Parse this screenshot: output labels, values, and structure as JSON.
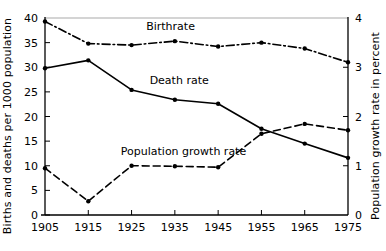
{
  "chart_data": {
    "type": "line",
    "title": "",
    "xlabel": "",
    "ylabel": "Births and deaths per 1000 population",
    "ylabel_right": "Population growth rate in percent",
    "x": [
      1905,
      1915,
      1925,
      1935,
      1945,
      1955,
      1965,
      1975
    ],
    "xtick_labels": [
      "1905",
      "1915",
      "1925",
      "1935",
      "1945",
      "1955",
      "1965",
      "1975"
    ],
    "xlim": [
      1905,
      1975
    ],
    "ylim": [
      0,
      40
    ],
    "ytick_labels": [
      "0",
      "5",
      "10",
      "15",
      "20",
      "25",
      "30",
      "35",
      "40"
    ],
    "yticks": [
      0,
      5,
      10,
      15,
      20,
      25,
      30,
      35,
      40
    ],
    "ylim_right": [
      0,
      4
    ],
    "ytick_labels_right": [
      "0",
      "1",
      "2",
      "3",
      "4"
    ],
    "yticks_right": [
      0,
      1,
      2,
      3,
      4
    ],
    "grid": false,
    "legend": "inline-annotations",
    "series": [
      {
        "name": "Birthrate",
        "axis": "left",
        "style": "dash-dot",
        "label_x": 1934,
        "label_y": 37.6,
        "values": [
          39.3,
          34.8,
          34.5,
          35.3,
          34.2,
          35.0,
          33.8,
          31.0
        ]
      },
      {
        "name": "Death rate",
        "axis": "left",
        "style": "solid",
        "label_x": 1936,
        "label_y": 26.6,
        "values": [
          29.8,
          31.4,
          25.4,
          23.4,
          22.6,
          17.5,
          14.5,
          11.6
        ]
      },
      {
        "name": "Population growth rate",
        "axis": "right",
        "style": "dashed",
        "label_x": 1937,
        "label_y": 12.2,
        "values": [
          0.95,
          0.28,
          1.0,
          0.99,
          0.97,
          1.65,
          1.85,
          1.72
        ]
      }
    ]
  }
}
